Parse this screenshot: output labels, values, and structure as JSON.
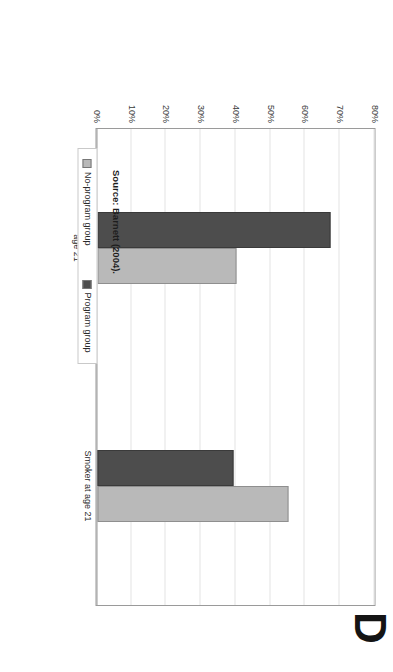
{
  "page": {
    "letter": "D"
  },
  "source": {
    "text": "Source: Barnett (2004)."
  },
  "legend": {
    "position": "bottom",
    "items": [
      {
        "label": "No-program group",
        "color": "#b9b9b9",
        "swatch_name": "legend-swatch-no-program"
      },
      {
        "label": "Program group",
        "color": "#4d4d4d",
        "swatch_name": "legend-swatch-program"
      }
    ]
  },
  "chart_data": {
    "type": "bar",
    "title": "",
    "subtitle": "",
    "xlabel": "",
    "ylabel": "",
    "categories": [
      "Skilled Job or Higher Education at age 21",
      "Smoker at age 21"
    ],
    "series": [
      {
        "name": "No-program group",
        "color": "#b9b9b9",
        "values": [
          40,
          55
        ]
      },
      {
        "name": "Program group",
        "color": "#4d4d4d",
        "values": [
          67,
          39
        ]
      }
    ],
    "ylim": [
      0,
      80
    ],
    "ytick_labels": [
      "0%",
      "10%",
      "20%",
      "30%",
      "40%",
      "50%",
      "60%",
      "70%",
      "80%"
    ],
    "ytick_values": [
      0,
      10,
      20,
      30,
      40,
      50,
      60,
      70,
      80
    ],
    "grid": true,
    "orientation": "vertical-bars-page-rotated-90cw"
  },
  "category_label_lines": [
    [
      "Skilled Job or Higher Education at",
      "age 21"
    ],
    [
      "Smoker at age 21"
    ]
  ]
}
